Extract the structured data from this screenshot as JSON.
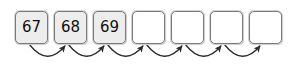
{
  "diagram": {
    "type": "sequence-boxes-with-arrows",
    "background_color": "#ffffff",
    "geometry": {
      "canvas_width": 307,
      "canvas_height": 71,
      "box_width": 33,
      "box_height": 33,
      "box_top": 11,
      "first_box_left": 15,
      "box_pitch": 39
    },
    "style": {
      "box_border_color": "#7a7a7a",
      "box_outer_shadow_color": "#d2d2d2",
      "filled_box_color": "#ededed",
      "empty_box_color": "#ffffff",
      "text_color": "#111111",
      "arrow_color": "#2b2b2b",
      "arrow_width": 1.3
    },
    "cells": [
      {
        "index": 0,
        "value": "67",
        "state": "filled"
      },
      {
        "index": 1,
        "value": "68",
        "state": "filled"
      },
      {
        "index": 2,
        "value": "69",
        "state": "filled"
      },
      {
        "index": 3,
        "value": "",
        "state": "empty"
      },
      {
        "index": 4,
        "value": "",
        "state": "empty"
      },
      {
        "index": 5,
        "value": "",
        "state": "empty"
      },
      {
        "index": 6,
        "value": "",
        "state": "empty"
      }
    ],
    "arrows": [
      {
        "index": 0,
        "from_cell": 0,
        "to_cell": 1,
        "shape": "curved-arc-below",
        "direction": "left-to-right"
      },
      {
        "index": 1,
        "from_cell": 1,
        "to_cell": 2,
        "shape": "curved-arc-below",
        "direction": "left-to-right"
      },
      {
        "index": 2,
        "from_cell": 2,
        "to_cell": 3,
        "shape": "curved-arc-below",
        "direction": "left-to-right"
      },
      {
        "index": 3,
        "from_cell": 3,
        "to_cell": 4,
        "shape": "curved-arc-below",
        "direction": "left-to-right"
      },
      {
        "index": 4,
        "from_cell": 4,
        "to_cell": 5,
        "shape": "curved-arc-below",
        "direction": "left-to-right"
      },
      {
        "index": 5,
        "from_cell": 5,
        "to_cell": 6,
        "shape": "curved-arc-below",
        "direction": "left-to-right"
      }
    ]
  }
}
